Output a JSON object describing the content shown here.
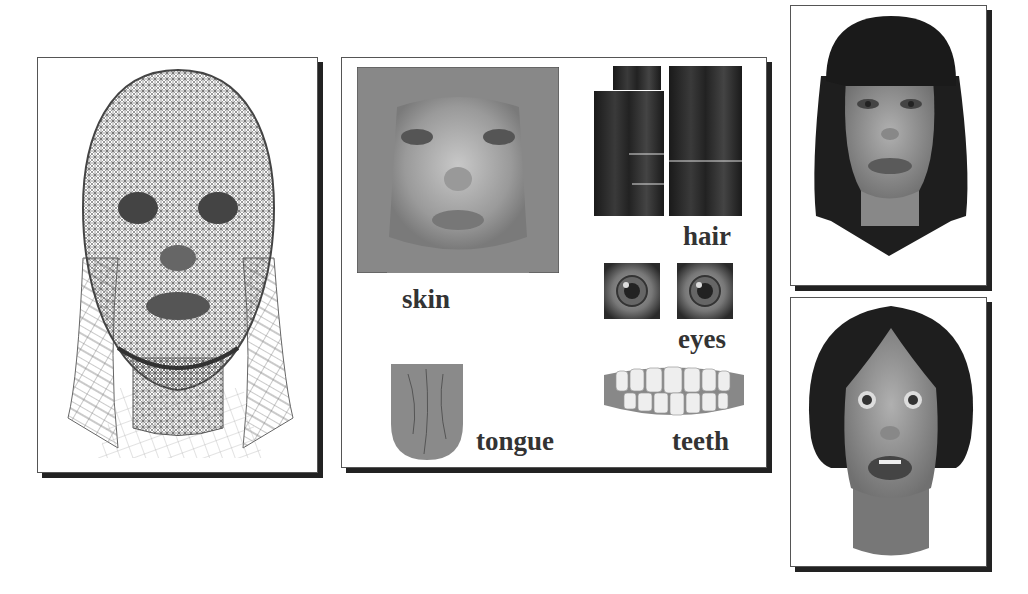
{
  "figure": {
    "panels": [
      {
        "id": "wireframe",
        "description": "Wireframe head mesh with hair"
      },
      {
        "id": "textures",
        "description": "Texture maps"
      },
      {
        "id": "render-neutral",
        "description": "Rendered face, neutral expression"
      },
      {
        "id": "render-surprised",
        "description": "Rendered face, surprised expression"
      }
    ],
    "texture_labels": {
      "skin": "skin",
      "hair": "hair",
      "eyes": "eyes",
      "tongue": "tongue",
      "teeth": "teeth"
    },
    "colors": {
      "panel_border": "#555555",
      "panel_shadow": "#222222",
      "label_text": "#333333",
      "hair": "#1e1e1e",
      "skin": "#8a8a8a"
    }
  }
}
